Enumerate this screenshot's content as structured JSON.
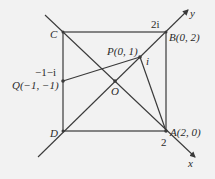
{
  "diagram": {
    "colors": {
      "background": "#f2f2f2",
      "line": "#3a3a3a",
      "text": "#2a2a2a"
    },
    "axes": {
      "x_label": "x",
      "y_label": "y"
    },
    "points": {
      "A": {
        "name": "A",
        "coords": "(2, 0)",
        "label": "A(2, 0)"
      },
      "B": {
        "name": "B",
        "coords": "(0, 2)",
        "label": "B(0, 2)"
      },
      "C": {
        "name": "C",
        "label": "C"
      },
      "D": {
        "name": "D",
        "label": "D"
      },
      "O": {
        "name": "O",
        "label": "O"
      },
      "P": {
        "name": "P",
        "coords": "(0, 1)",
        "label": "P(0, 1)"
      },
      "Q": {
        "name": "Q",
        "coords": "(−1, −1)",
        "label": "Q(−1, −1)"
      }
    },
    "complex_labels": {
      "two_i": "2i",
      "i": "i",
      "minus_one_minus_i": "−1−i",
      "two": "2"
    }
  }
}
